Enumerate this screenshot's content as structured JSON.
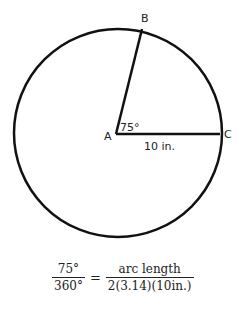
{
  "diagram": {
    "points": {
      "A": {
        "label": "A",
        "x": 116,
        "y": 134
      },
      "B": {
        "label": "B",
        "x": 142,
        "y": 29
      },
      "C": {
        "label": "C",
        "x": 220,
        "y": 134
      }
    },
    "angle_label": "75°",
    "radius_label": "10 in.",
    "circle": {
      "cx": 118,
      "cy": 133,
      "r": 104
    }
  },
  "equation": {
    "left_numerator": "75°",
    "left_denominator": "360°",
    "equals": "=",
    "right_numerator": "arc length",
    "right_denominator": "2(3.14)(10in.)"
  }
}
